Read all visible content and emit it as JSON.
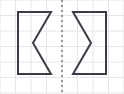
{
  "canvas": {
    "width": 124,
    "height": 94,
    "background_color": "#ffffff",
    "title": "Mirror image chevron pair on grid"
  },
  "grid": {
    "name": "graph-paper-grid",
    "cell_size": 15.5,
    "line_color": "#e6e6ea",
    "line_width": 1,
    "columns": 8,
    "rows": 6,
    "visible": true
  },
  "symmetry_line": {
    "label": "line of symmetry",
    "orientation": "vertical",
    "x": 62,
    "y_start": 0,
    "y_end": 94,
    "color": "#6f6f80",
    "style": "dashed",
    "dash_pattern": "2 3",
    "width": 1.4
  },
  "shapes": [
    {
      "name": "left-chevron",
      "label": "Left figure",
      "stroke_color": "#3c3c46",
      "fill_color": "none",
      "stroke_width": 2,
      "points": "18,12 51,12 33,43 51,74 18,74",
      "vertices": [
        {
          "x": 18,
          "y": 12
        },
        {
          "x": 51,
          "y": 12
        },
        {
          "x": 33,
          "y": 43
        },
        {
          "x": 51,
          "y": 74
        },
        {
          "x": 18,
          "y": 74
        }
      ]
    },
    {
      "name": "right-chevron",
      "label": "Right figure",
      "stroke_color": "#3c3c46",
      "fill_color": "none",
      "stroke_width": 2,
      "points": "106,12 73,12 91,43 73,74 106,74",
      "vertices": [
        {
          "x": 106,
          "y": 12
        },
        {
          "x": 73,
          "y": 12
        },
        {
          "x": 91,
          "y": 43
        },
        {
          "x": 73,
          "y": 74
        },
        {
          "x": 106,
          "y": 74
        }
      ]
    }
  ],
  "chart_data": {
    "type": "scatter",
    "xlabel": "",
    "ylabel": "",
    "xlim": [
      0,
      124
    ],
    "ylim": [
      0,
      94
    ],
    "grid": true,
    "legend": "none",
    "series": [
      {
        "name": "left-chevron",
        "x": [
          18,
          51,
          33,
          51,
          18,
          18
        ],
        "y": [
          12,
          12,
          43,
          74,
          74,
          12
        ]
      },
      {
        "name": "right-chevron",
        "x": [
          106,
          73,
          91,
          73,
          106,
          106
        ],
        "y": [
          12,
          12,
          43,
          74,
          74,
          12
        ]
      },
      {
        "name": "symmetry-line",
        "x": [
          62,
          62
        ],
        "y": [
          0,
          94
        ]
      }
    ],
    "annotations": []
  }
}
